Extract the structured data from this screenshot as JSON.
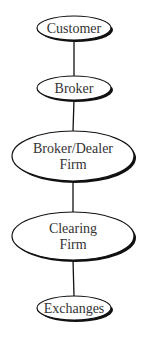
{
  "diagram": {
    "type": "vertical-flow",
    "nodes": [
      {
        "id": "customer",
        "lines": [
          "Customer"
        ],
        "cx": 74,
        "cy": 28,
        "rx": 37,
        "ry": 12,
        "font_size": 14
      },
      {
        "id": "broker",
        "lines": [
          "Broker"
        ],
        "cx": 74,
        "cy": 88,
        "rx": 37,
        "ry": 12,
        "font_size": 14
      },
      {
        "id": "broker-dealer-firm",
        "lines": [
          "Broker/Dealer",
          "Firm"
        ],
        "cx": 73,
        "cy": 156,
        "rx": 61,
        "ry": 25,
        "font_size": 14
      },
      {
        "id": "clearing-firm",
        "lines": [
          "Clearing",
          "Firm"
        ],
        "cx": 73,
        "cy": 236,
        "rx": 61,
        "ry": 24,
        "font_size": 14
      },
      {
        "id": "exchanges",
        "lines": [
          "Exchanges"
        ],
        "cx": 74,
        "cy": 308,
        "rx": 37,
        "ry": 12,
        "font_size": 14
      }
    ],
    "edges": [
      {
        "from": "customer",
        "to": "broker"
      },
      {
        "from": "broker",
        "to": "broker-dealer-firm"
      },
      {
        "from": "broker-dealer-firm",
        "to": "clearing-firm"
      },
      {
        "from": "clearing-firm",
        "to": "exchanges"
      }
    ],
    "colors": {
      "stroke": "#111111",
      "fill": "#ffffff",
      "shadow": "#111111",
      "text": "#333333"
    }
  }
}
